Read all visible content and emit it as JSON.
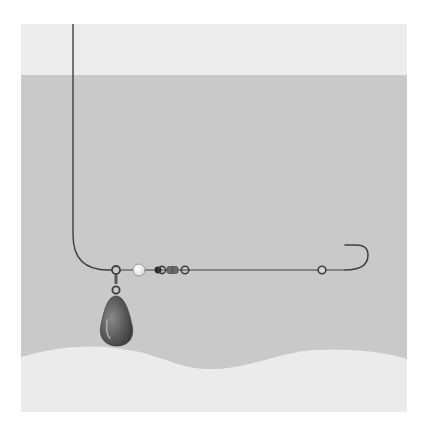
{
  "colors": {
    "background": "#ffffff",
    "air": "#ececec",
    "water": "#c9c9c9",
    "seabed": "#ebebeb",
    "line": "#3f3f3f",
    "sinker": "#5a5a5a",
    "bead_light": "#f4f4f4",
    "bead_dark": "#2a2a2a"
  },
  "components": [
    {
      "name": "main-line"
    },
    {
      "name": "ring"
    },
    {
      "name": "sinker"
    },
    {
      "name": "bead"
    },
    {
      "name": "swivel"
    },
    {
      "name": "leader"
    },
    {
      "name": "hook"
    }
  ]
}
